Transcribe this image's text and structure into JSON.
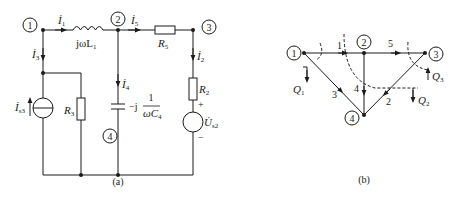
{
  "figure_a": {
    "caption": "(a)",
    "nodes": [
      "1",
      "2",
      "3",
      "4"
    ],
    "currents": {
      "i1": "İ",
      "i1_sub": "1",
      "i2": "İ",
      "i2_sub": "2",
      "i3": "İ",
      "i3_sub": "3",
      "i4": "İ",
      "i4_sub": "4",
      "i5": "İ",
      "i5_sub": "5"
    },
    "components": {
      "inductor": "jωL",
      "inductor_sub": "1",
      "r5": "R",
      "r5_sub": "5",
      "r3": "R",
      "r3_sub": "3",
      "r2": "R",
      "r2_sub": "2",
      "cap_prefix": "−j",
      "cap_num": "1",
      "cap_den": "ωC",
      "cap_den_sub": "4",
      "is3": "İ",
      "is3_sub": "s3",
      "us2": "U̇",
      "us2_sub": "s2",
      "plus": "+",
      "minus": "−"
    }
  },
  "figure_b": {
    "caption": "(b)",
    "nodes": [
      "1",
      "2",
      "3",
      "4"
    ],
    "branches": [
      "1",
      "2",
      "3",
      "4",
      "5"
    ],
    "cutsets": {
      "q1": "Q",
      "q1_sub": "1",
      "q2": "Q",
      "q2_sub": "2",
      "q3": "Q",
      "q3_sub": "3"
    }
  }
}
